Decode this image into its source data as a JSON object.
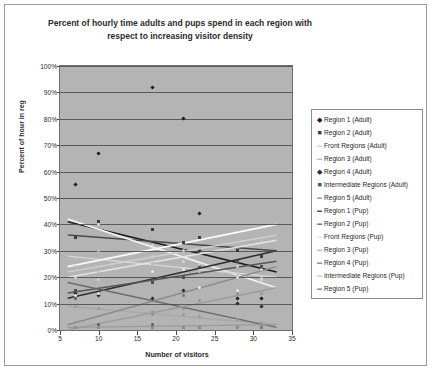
{
  "chart_data": {
    "type": "scatter",
    "title": "Percent of hourly time adults and pups spend in each region with respect to increasing visitor density",
    "xlabel": "Number of visitors",
    "ylabel": "Percent of hour in reg",
    "xlim": [
      5,
      35
    ],
    "ylim": [
      0,
      100
    ],
    "xticks": [
      5,
      10,
      15,
      20,
      25,
      30,
      35
    ],
    "yticks": [
      "0%",
      "10%",
      "20%",
      "30%",
      "40%",
      "50%",
      "60%",
      "70%",
      "80%",
      "90%",
      "100%"
    ],
    "grid": "horizontal",
    "legend_position": "right",
    "plot_background": "#b4b4b4",
    "series": [
      {
        "name": "Region 1 (Adult)",
        "marker": "diamond",
        "color": "#1a1a1a",
        "points": [
          [
            7,
            55
          ],
          [
            10,
            67
          ],
          [
            17,
            92
          ],
          [
            21,
            80
          ],
          [
            23,
            44
          ],
          [
            28,
            12
          ],
          [
            31,
            12
          ]
        ],
        "trend": {
          "x1": 6,
          "y1": 41,
          "x2": 33,
          "y2": 22,
          "color": "#1a1a1a",
          "width": 1.6
        }
      },
      {
        "name": "Region 2 (Adult)",
        "marker": "square",
        "color": "#3c3c3c",
        "points": [
          [
            7,
            35
          ],
          [
            10,
            41
          ],
          [
            17,
            38
          ],
          [
            21,
            33
          ],
          [
            23,
            35
          ],
          [
            28,
            30
          ],
          [
            31,
            28
          ]
        ],
        "trend": {
          "x1": 6,
          "y1": 36,
          "x2": 33,
          "y2": 30,
          "color": "#4a4a4a",
          "width": 1.5
        }
      },
      {
        "name": "Front Regions (Adult)",
        "marker": "dash",
        "color": "#d8d8d8",
        "points": [
          [
            7,
            41
          ],
          [
            10,
            40
          ],
          [
            17,
            32
          ],
          [
            21,
            26
          ],
          [
            23,
            24
          ],
          [
            28,
            20
          ],
          [
            31,
            19
          ]
        ],
        "trend": {
          "x1": 6,
          "y1": 42,
          "x2": 33,
          "y2": 16,
          "color": "#f2f2f2",
          "width": 1.8
        }
      },
      {
        "name": "Region 3 (Adult)",
        "marker": "dash",
        "color": "#c0c0c0",
        "points": [
          [
            7,
            27
          ],
          [
            10,
            30
          ],
          [
            17,
            25
          ],
          [
            21,
            23
          ],
          [
            23,
            22
          ],
          [
            28,
            21
          ],
          [
            31,
            20
          ]
        ],
        "trend": {
          "x1": 6,
          "y1": 28,
          "x2": 33,
          "y2": 20,
          "color": "#d6d6d6",
          "width": 1.4
        }
      },
      {
        "name": "Region 4 (Adult)",
        "marker": "diamond",
        "color": "#2a2a2a",
        "points": [
          [
            7,
            14
          ],
          [
            10,
            13
          ],
          [
            17,
            12
          ],
          [
            21,
            15
          ],
          [
            23,
            30
          ],
          [
            28,
            10
          ],
          [
            31,
            9
          ]
        ],
        "trend": {
          "x1": 6,
          "y1": 12,
          "x2": 33,
          "y2": 30,
          "color": "#2f2f2f",
          "width": 1.6
        }
      },
      {
        "name": "Intermediate Regions (Adult)",
        "marker": "square",
        "color": "#4f4f4f",
        "points": [
          [
            7,
            15
          ],
          [
            10,
            14
          ],
          [
            17,
            18
          ],
          [
            21,
            20
          ],
          [
            23,
            24
          ],
          [
            28,
            26
          ],
          [
            31,
            24
          ]
        ],
        "trend": {
          "x1": 6,
          "y1": 14,
          "x2": 33,
          "y2": 26,
          "color": "#555555",
          "width": 1.5
        }
      },
      {
        "name": "Region 5 (Adult)",
        "marker": "dash",
        "color": "#9a9a9a",
        "points": [
          [
            7,
            9
          ],
          [
            10,
            8
          ],
          [
            17,
            7
          ],
          [
            21,
            6
          ],
          [
            23,
            5
          ],
          [
            28,
            4
          ],
          [
            31,
            3
          ]
        ],
        "trend": {
          "x1": 6,
          "y1": 9,
          "x2": 33,
          "y2": 2,
          "color": "#a8a8a8",
          "width": 1.4
        }
      },
      {
        "name": "Region 1 (Pup)",
        "marker": "dash",
        "color": "#5a5a5a",
        "points": [
          [
            7,
            12
          ],
          [
            10,
            2
          ],
          [
            17,
            2
          ],
          [
            21,
            1
          ],
          [
            23,
            1
          ],
          [
            28,
            1
          ],
          [
            31,
            1
          ]
        ],
        "trend": {
          "x1": 6,
          "y1": 18,
          "x2": 33,
          "y2": 1,
          "color": "#6a6a6a",
          "width": 1.5
        }
      },
      {
        "name": "Region 2 (Pup)",
        "marker": "dash",
        "color": "#7a7a7a",
        "points": [
          [
            7,
            1
          ],
          [
            10,
            1
          ],
          [
            17,
            1
          ],
          [
            21,
            13
          ],
          [
            23,
            1
          ],
          [
            28,
            1
          ],
          [
            31,
            1
          ]
        ],
        "trend": {
          "x1": 6,
          "y1": 2,
          "x2": 33,
          "y2": 24,
          "color": "#8a8a8a",
          "width": 1.5
        }
      },
      {
        "name": "Front Regions (Pup)",
        "marker": "dash",
        "color": "#e8e8e8",
        "points": [
          [
            7,
            13
          ],
          [
            10,
            14
          ],
          [
            17,
            22
          ],
          [
            21,
            23
          ],
          [
            23,
            16
          ],
          [
            28,
            15
          ],
          [
            31,
            14
          ]
        ],
        "trend": {
          "x1": 6,
          "y1": 24,
          "x2": 33,
          "y2": 40,
          "color": "#fafafa",
          "width": 1.8
        }
      },
      {
        "name": "Region 3 (Pup)",
        "marker": "dash",
        "color": "#bdbdbd",
        "points": [
          [
            7,
            24
          ],
          [
            10,
            22
          ],
          [
            17,
            26
          ],
          [
            21,
            29
          ],
          [
            23,
            31
          ],
          [
            28,
            33
          ],
          [
            31,
            34
          ]
        ],
        "trend": {
          "x1": 6,
          "y1": 22,
          "x2": 33,
          "y2": 36,
          "color": "#cfcfcf",
          "width": 1.5
        }
      },
      {
        "name": "Region 4 (Pup)",
        "marker": "dash",
        "color": "#909090",
        "points": [
          [
            7,
            1
          ],
          [
            10,
            1
          ],
          [
            17,
            6
          ],
          [
            21,
            8
          ],
          [
            23,
            11
          ],
          [
            28,
            14
          ],
          [
            31,
            14
          ]
        ],
        "trend": {
          "x1": 6,
          "y1": 0,
          "x2": 33,
          "y2": 16,
          "color": "#9c9c9c",
          "width": 1.5
        }
      },
      {
        "name": "Intermediate Regions (Pup)",
        "marker": "dash",
        "color": "#d0d0d0",
        "points": [
          [
            7,
            20
          ],
          [
            10,
            19
          ],
          [
            17,
            28
          ],
          [
            21,
            30
          ],
          [
            23,
            25
          ],
          [
            28,
            24
          ],
          [
            31,
            23
          ]
        ],
        "trend": {
          "x1": 6,
          "y1": 20,
          "x2": 33,
          "y2": 34,
          "color": "#e4e4e4",
          "width": 1.6
        }
      },
      {
        "name": "Region 5 (Pup)",
        "marker": "dash",
        "color": "#8e8e8e",
        "points": [
          [
            7,
            1
          ],
          [
            10,
            1
          ],
          [
            17,
            1
          ],
          [
            21,
            1
          ],
          [
            23,
            1
          ],
          [
            28,
            1
          ],
          [
            31,
            2
          ]
        ],
        "trend": {
          "x1": 6,
          "y1": 1,
          "x2": 33,
          "y2": 2,
          "color": "#9a9a9a",
          "width": 1.3
        }
      }
    ]
  }
}
